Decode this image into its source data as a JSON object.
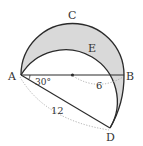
{
  "diagram": {
    "type": "geometry",
    "points": {
      "A": {
        "label": "A"
      },
      "B": {
        "label": "B"
      },
      "C": {
        "label": "C"
      },
      "D": {
        "label": "D"
      },
      "E": {
        "label": "E"
      }
    },
    "measurements": {
      "angle_A": "30°",
      "radius": "6",
      "AD_length": "12"
    },
    "colors": {
      "shade": "#d9d9d9",
      "stroke": "#2b2b2b",
      "dotted": "#9a9a9a"
    }
  }
}
